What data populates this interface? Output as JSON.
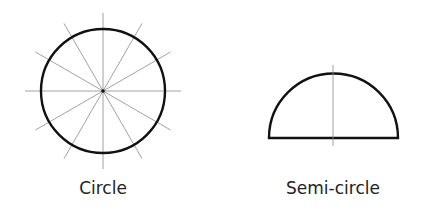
{
  "figures": [
    {
      "name": "circle",
      "label": "Circle",
      "radial_lines": 12
    },
    {
      "name": "semi-circle",
      "label": "Semi-circle"
    }
  ],
  "colors": {
    "outline": "#111111",
    "guide": "#8a8a8a",
    "text": "#222222"
  }
}
